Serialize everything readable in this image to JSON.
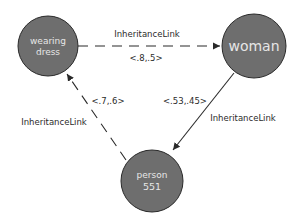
{
  "diagram": {
    "colors": {
      "node_fill": "#6e6e6e",
      "node_stroke": "#2a2a2a",
      "node_text": "#e6e6e6",
      "edge": "#2a2a2a",
      "label_text": "#2b2b2b",
      "background": "#ffffff"
    },
    "nodes": [
      {
        "id": "wearing-dress",
        "line1": "wearing",
        "line2": "dress"
      },
      {
        "id": "woman",
        "line1": "woman"
      },
      {
        "id": "person-551",
        "line1": "person",
        "line2": "551"
      }
    ],
    "edges": [
      {
        "from": "wearing dress",
        "to": "woman",
        "style": "dashed",
        "type": "InheritanceLink",
        "truth_value": "<.8,.5>"
      },
      {
        "from": "woman",
        "to": "person 551",
        "style": "solid",
        "type": "InheritanceLink",
        "truth_value": "<.53,.45>"
      },
      {
        "from": "person 551",
        "to": "wearing dress",
        "style": "dashed",
        "type": "InheritanceLink",
        "truth_value": "<.7,.6>"
      }
    ]
  }
}
